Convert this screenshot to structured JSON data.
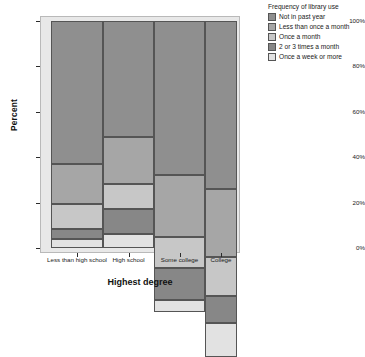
{
  "chart_data": {
    "type": "bar",
    "subtype": "mosaic-spineplot-100-stacked",
    "title": "",
    "xlabel": "Highest degree",
    "ylabel": "Percent",
    "ylim": [
      0,
      100
    ],
    "ytick_labels": [
      "0%",
      "20%",
      "40%",
      "60%",
      "80%",
      "100%"
    ],
    "ytick_values": [
      0,
      20,
      40,
      60,
      80,
      100
    ],
    "grid": false,
    "legend_position": "right",
    "legend_title": "Frequency of library use",
    "categories": [
      "Less than high school",
      "High school",
      "Some college",
      "College"
    ],
    "category_widths_pct": [
      28,
      27.4,
      27.4,
      17.2
    ],
    "series": [
      {
        "name": "Not in past year",
        "color": "#8f8f8f",
        "values": [
          63.0,
          51.0,
          68.0,
          74.0
        ]
      },
      {
        "name": "Less than once a month",
        "color": "#a6a6a6",
        "values": [
          17.5,
          21.0,
          27.0,
          30.0
        ]
      },
      {
        "name": "Once a month",
        "color": "#c7c7c7",
        "values": [
          11.0,
          11.0,
          14.0,
          17.0
        ]
      },
      {
        "name": "2 or 3 times a month",
        "color": "#878787",
        "values": [
          4.5,
          11.0,
          14.0,
          12.0
        ]
      },
      {
        "name": "Once a week or more",
        "color": "#e2e2e2",
        "values": [
          4.0,
          6.0,
          5.0,
          15.0
        ]
      }
    ]
  },
  "axes": {
    "ylabel": "Percent",
    "xlabel": "Highest degree"
  },
  "legend": {
    "title": "Frequency of library use",
    "items": [
      {
        "label": "Not in past year",
        "color": "#8f8f8f"
      },
      {
        "label": "Less than once a month",
        "color": "#a6a6a6"
      },
      {
        "label": "Once a month",
        "color": "#c7c7c7"
      },
      {
        "label": "2 or 3 times a month",
        "color": "#878787"
      },
      {
        "label": "Once a week or more",
        "color": "#e2e2e2"
      }
    ]
  },
  "colors": {
    "plot_background": "#e8e8e8",
    "segment_border": "#555555",
    "frame_border": "#b9b9b9",
    "text": "#1a1a1a"
  }
}
